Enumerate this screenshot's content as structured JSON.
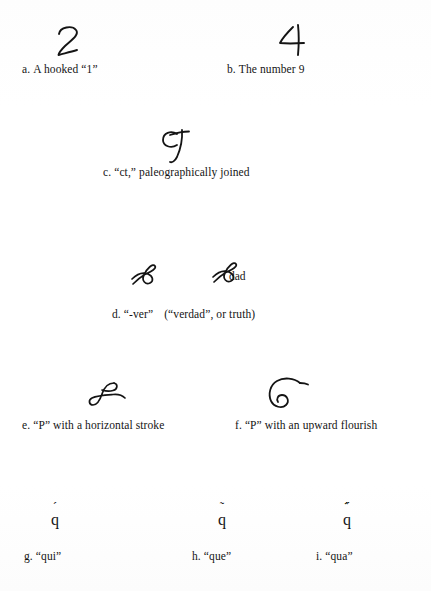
{
  "page": {
    "kind": "scanned-figure",
    "background_color": "#ffffff",
    "ink_color": "#141414",
    "width": 431,
    "height": 591
  },
  "figure": {
    "entries": [
      {
        "key": "a",
        "label": "a.",
        "caption": "A hooked “1”",
        "glyph_name": "hooked-one-glyph",
        "glyph_description": "handwritten hooked numeral one resembling a 2"
      },
      {
        "key": "b",
        "label": "b.",
        "caption": "The number 9",
        "glyph_name": "number-nine-glyph",
        "glyph_description": "handwritten numeral nine resembling a 4"
      },
      {
        "key": "c",
        "label": "c.",
        "caption": "“ct,” paleographically joined",
        "glyph_name": "ct-ligature-glyph",
        "glyph_description": "c joined to t forming a ligature like a script 9"
      },
      {
        "key": "d",
        "label": "d.",
        "caption": "“-ver”",
        "caption_secondary": "(“verdad”, or truth)",
        "glyph_name": "ver-abbreviation-glyph",
        "glyph_description": "looped script ver abbreviation",
        "inline_word": "dad"
      },
      {
        "key": "e",
        "label": "e.",
        "caption": "“P” with a horizontal stroke",
        "glyph_name": "p-horizontal-stroke-glyph",
        "glyph_description": "script capital P crossed by a horizontal stroke"
      },
      {
        "key": "f",
        "label": "f.",
        "caption": "“P” with an upward flourish",
        "glyph_name": "p-upward-flourish-glyph",
        "glyph_description": "script capital P with a large upward curved flourish"
      },
      {
        "key": "g",
        "label": "g.",
        "caption": "“qui”",
        "glyph_name": "q-acute-glyph",
        "glyph_base": "q",
        "glyph_mark": "´",
        "glyph_description": "letter q with an acute-like superscript stroke"
      },
      {
        "key": "h",
        "label": "h.",
        "caption": "“que”",
        "glyph_name": "q-tilde-glyph",
        "glyph_base": "q",
        "glyph_mark": "˜",
        "glyph_description": "letter q with a tilde above"
      },
      {
        "key": "i",
        "label": "i.",
        "caption": "“qua”",
        "glyph_name": "q-double-tilde-glyph",
        "glyph_base": "q",
        "glyph_mark": "᷀᷀",
        "glyph_description": "letter q with a doubled wavy stroke above"
      }
    ],
    "inline_labels": {
      "d_dad": "dad"
    }
  }
}
